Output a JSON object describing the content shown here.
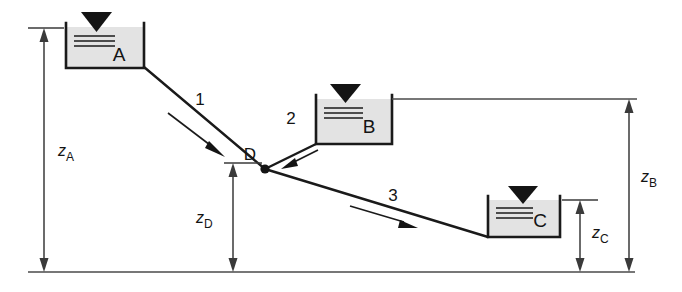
{
  "diagram": {
    "type": "three-reservoir-pipe-network",
    "background_color": "#ffffff",
    "line_color": "#1a1a1a",
    "tank_fill_color": "#e3e3e3"
  },
  "tanks": [
    {
      "id": "tank-a",
      "label": "A",
      "surface_marker": "water-surface-triangle",
      "x": 66,
      "y": 27,
      "w": 78,
      "h": 41
    },
    {
      "id": "tank-b",
      "label": "B",
      "surface_marker": "water-surface-triangle",
      "x": 316,
      "y": 99,
      "w": 76,
      "h": 45
    },
    {
      "id": "tank-c",
      "label": "C",
      "surface_marker": "water-surface-triangle",
      "x": 488,
      "y": 200,
      "w": 72,
      "h": 37
    }
  ],
  "pipes": [
    {
      "id": "pipe-1",
      "label": "1",
      "from": "A",
      "to": "D",
      "flow_direction": "toward-D"
    },
    {
      "id": "pipe-2",
      "label": "2",
      "from": "B",
      "to": "D",
      "flow_direction": "toward-D"
    },
    {
      "id": "pipe-3",
      "label": "3",
      "from": "D",
      "to": "C",
      "flow_direction": "toward-C"
    }
  ],
  "nodes": [
    {
      "id": "junction-d",
      "label": "D",
      "x": 265,
      "y": 169
    }
  ],
  "dimensions": [
    {
      "id": "dim-za",
      "symbol": "z",
      "subscript": "A",
      "measures": "elevation of reservoir A surface above datum"
    },
    {
      "id": "dim-zd",
      "symbol": "z",
      "subscript": "D",
      "measures": "elevation of junction D above datum"
    },
    {
      "id": "dim-zb",
      "symbol": "z",
      "subscript": "B",
      "measures": "elevation of reservoir B surface above datum"
    },
    {
      "id": "dim-zc",
      "symbol": "z",
      "subscript": "C",
      "measures": "elevation of reservoir C surface above datum"
    }
  ],
  "datum": {
    "id": "datum-line",
    "label": "",
    "y": 272
  }
}
